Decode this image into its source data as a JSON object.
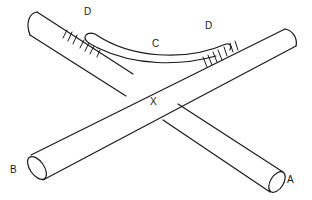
{
  "diagram": {
    "labels": {
      "a": "A",
      "b": "B",
      "c": "C",
      "d_left": "D",
      "d_right": "D",
      "x": "X"
    },
    "colors": {
      "stroke": "#1a1a1a",
      "background": "#ffffff"
    },
    "parts": [
      {
        "id": "rod-a",
        "description": "Cylindrical rod running from upper-left to end A (lower-right)"
      },
      {
        "id": "rod-b",
        "description": "Cylindrical rod running from end B (lower-left) to upper-right"
      },
      {
        "id": "sleeve-c",
        "description": "Curved sleeve C bridging the two rods, bound at each end D"
      },
      {
        "id": "crossing-x",
        "description": "Crossing point X where the rods overlap"
      }
    ]
  }
}
